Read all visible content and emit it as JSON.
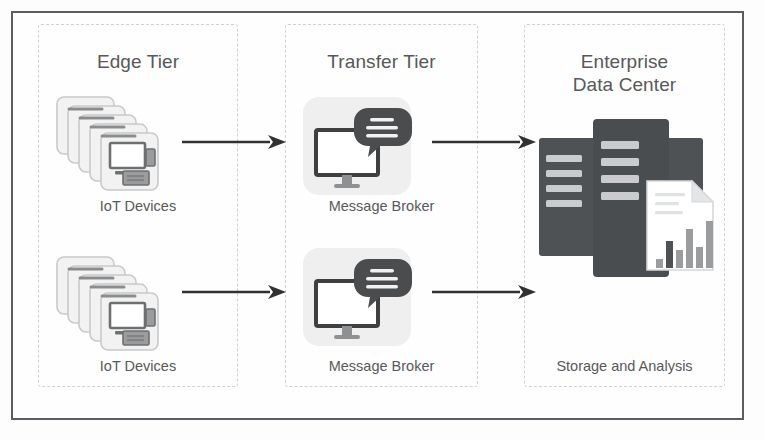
{
  "diagram": {
    "frame": {
      "border_color": "#5a5d61",
      "background": "#fefefe"
    },
    "panel_border_color": "#cfd2d4",
    "text_color": "#58585a",
    "arrow_color": "#2f3133",
    "tiers": [
      {
        "id": "edge",
        "title": "Edge Tier",
        "nodes": [
          {
            "icon": "iot-device-stack-icon",
            "label": "IoT Devices"
          },
          {
            "icon": "iot-device-stack-icon",
            "label": "IoT Devices"
          }
        ]
      },
      {
        "id": "transfer",
        "title": "Transfer Tier",
        "nodes": [
          {
            "icon": "message-broker-icon",
            "label": "Message Broker"
          },
          {
            "icon": "message-broker-icon",
            "label": "Message Broker"
          }
        ]
      },
      {
        "id": "enterprise",
        "title": "Enterprise\nData Center",
        "nodes": [
          {
            "icon": "server-rack-report-icon",
            "label": "Storage and Analysis"
          }
        ]
      }
    ],
    "flows": [
      {
        "id": "flow-edge-to-transfer-top",
        "from": "IoT Devices",
        "to": "Message Broker",
        "style": "solid-arrow"
      },
      {
        "id": "flow-edge-to-transfer-bottom",
        "from": "IoT Devices",
        "to": "Message Broker",
        "style": "solid-arrow"
      },
      {
        "id": "flow-transfer-to-enterprise-top",
        "from": "Message Broker",
        "to": "Enterprise Data Center",
        "style": "solid-arrow"
      },
      {
        "id": "flow-transfer-to-enterprise-bot",
        "from": "Message Broker",
        "to": "Enterprise Data Center",
        "style": "solid-arrow"
      }
    ],
    "icon_palette": {
      "card_fill": "#f2f2f2",
      "card_stroke": "#c9c9c9",
      "device_dark": "#6d6f71",
      "device_mid": "#9a9c9e",
      "tile_fill": "#efefef",
      "monitor_stroke": "#3d3f41",
      "bubble_fill": "#4a4c4e",
      "server_fill": "#4f5254",
      "server_bar": "#c9cbcd",
      "doc_fill": "#ffffff",
      "doc_stroke": "#d5d7d9",
      "chart_bar": "#9a9c9e",
      "chart_bar_dark": "#4f5254"
    },
    "report_chart": {
      "type": "bar",
      "bars": [
        3,
        9,
        6,
        13,
        7,
        16
      ],
      "bar_count": 6
    }
  }
}
